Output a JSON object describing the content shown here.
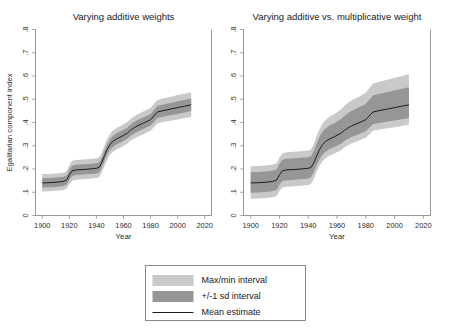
{
  "figure": {
    "width": 449,
    "height": 330,
    "background": "#ffffff"
  },
  "colors": {
    "maxmin_band": "#c9c9c9",
    "sd_band": "#969696",
    "mean_line": "#1c1c1c",
    "axis": "#8a8a8a",
    "text": "#1a1a1a"
  },
  "legend": {
    "position": "bottom-center",
    "items": [
      {
        "label": "Max/min interval",
        "marker": "filled-swatch",
        "color": "#c9c9c9"
      },
      {
        "label": "+/-1 sd interval",
        "marker": "filled-swatch",
        "color": "#969696"
      },
      {
        "label": "Mean estimate",
        "marker": "line",
        "color": "#1c1c1c"
      }
    ]
  },
  "chart_data": [
    {
      "type": "area",
      "panel": "left",
      "title": "Varying additive weights",
      "xlabel": "Year",
      "ylabel": "Egalitarian component index",
      "xlim": [
        1895,
        2025
      ],
      "ylim": [
        0,
        0.8
      ],
      "xticks": [
        1900,
        1920,
        1940,
        1960,
        1980,
        2000,
        2020
      ],
      "xticklabels": [
        "1900",
        "1920",
        "1940",
        "1960",
        "1980",
        "2000",
        "2020"
      ],
      "yticks": [
        0,
        0.1,
        0.2,
        0.3,
        0.4,
        0.5,
        0.6,
        0.7,
        0.8
      ],
      "yticklabels": [
        "0",
        ".1",
        ".2",
        ".3",
        ".4",
        ".5",
        ".6",
        ".7",
        ".8"
      ],
      "grid": false,
      "x": [
        1900,
        1905,
        1910,
        1915,
        1918,
        1920,
        1922,
        1925,
        1930,
        1935,
        1938,
        1940,
        1942,
        1944,
        1946,
        1948,
        1950,
        1952,
        1955,
        1958,
        1960,
        1963,
        1965,
        1968,
        1970,
        1975,
        1980,
        1983,
        1985,
        1990,
        1995,
        2000,
        2005,
        2010
      ],
      "series": [
        {
          "name": "Mean estimate",
          "values": [
            0.14,
            0.141,
            0.143,
            0.146,
            0.152,
            0.175,
            0.192,
            0.196,
            0.198,
            0.2,
            0.202,
            0.203,
            0.207,
            0.228,
            0.258,
            0.285,
            0.305,
            0.318,
            0.33,
            0.338,
            0.345,
            0.355,
            0.366,
            0.378,
            0.385,
            0.398,
            0.412,
            0.432,
            0.445,
            0.452,
            0.458,
            0.464,
            0.47,
            0.476
          ]
        },
        {
          "name": "+/-1 sd lower",
          "values": [
            0.12,
            0.121,
            0.123,
            0.126,
            0.132,
            0.154,
            0.17,
            0.174,
            0.176,
            0.178,
            0.18,
            0.181,
            0.185,
            0.206,
            0.235,
            0.262,
            0.282,
            0.294,
            0.306,
            0.314,
            0.321,
            0.331,
            0.342,
            0.353,
            0.36,
            0.373,
            0.387,
            0.406,
            0.419,
            0.426,
            0.432,
            0.437,
            0.443,
            0.449
          ]
        },
        {
          "name": "+/-1 sd upper",
          "values": [
            0.16,
            0.161,
            0.163,
            0.166,
            0.172,
            0.196,
            0.214,
            0.218,
            0.22,
            0.222,
            0.224,
            0.225,
            0.229,
            0.25,
            0.281,
            0.308,
            0.328,
            0.342,
            0.354,
            0.362,
            0.369,
            0.379,
            0.39,
            0.403,
            0.41,
            0.423,
            0.437,
            0.458,
            0.471,
            0.478,
            0.484,
            0.491,
            0.497,
            0.503
          ]
        },
        {
          "name": "Max/min lower",
          "values": [
            0.103,
            0.104,
            0.106,
            0.109,
            0.115,
            0.134,
            0.15,
            0.154,
            0.156,
            0.158,
            0.16,
            0.161,
            0.165,
            0.186,
            0.214,
            0.241,
            0.261,
            0.273,
            0.285,
            0.293,
            0.3,
            0.31,
            0.321,
            0.331,
            0.338,
            0.351,
            0.364,
            0.383,
            0.396,
            0.403,
            0.408,
            0.413,
            0.419,
            0.424
          ]
        },
        {
          "name": "Max/min upper",
          "values": [
            0.178,
            0.179,
            0.181,
            0.184,
            0.19,
            0.216,
            0.235,
            0.239,
            0.241,
            0.243,
            0.245,
            0.246,
            0.25,
            0.272,
            0.303,
            0.331,
            0.351,
            0.365,
            0.377,
            0.385,
            0.392,
            0.403,
            0.414,
            0.427,
            0.434,
            0.448,
            0.462,
            0.484,
            0.497,
            0.504,
            0.511,
            0.518,
            0.524,
            0.53
          ]
        }
      ]
    },
    {
      "type": "area",
      "panel": "right",
      "title": "Varying additive vs. multiplicative weight",
      "xlabel": "Year",
      "ylabel": "",
      "xlim": [
        1895,
        2025
      ],
      "ylim": [
        0,
        0.8
      ],
      "xticks": [
        1900,
        1920,
        1940,
        1960,
        1980,
        2000,
        2020
      ],
      "xticklabels": [
        "1900",
        "1920",
        "1940",
        "1960",
        "1980",
        "2000",
        "2020"
      ],
      "yticks": [
        0,
        0.1,
        0.2,
        0.3,
        0.4,
        0.5,
        0.6,
        0.7,
        0.8
      ],
      "yticklabels": [
        "0",
        ".1",
        ".2",
        ".3",
        ".4",
        ".5",
        ".6",
        ".7",
        ".8"
      ],
      "grid": false,
      "x": [
        1900,
        1905,
        1910,
        1915,
        1918,
        1920,
        1922,
        1925,
        1930,
        1935,
        1938,
        1940,
        1942,
        1944,
        1946,
        1948,
        1950,
        1952,
        1955,
        1958,
        1960,
        1963,
        1965,
        1968,
        1970,
        1975,
        1980,
        1983,
        1985,
        1990,
        1995,
        2000,
        2005,
        2010
      ],
      "series": [
        {
          "name": "Mean estimate",
          "values": [
            0.14,
            0.141,
            0.143,
            0.146,
            0.152,
            0.175,
            0.192,
            0.196,
            0.198,
            0.2,
            0.202,
            0.203,
            0.207,
            0.228,
            0.258,
            0.285,
            0.305,
            0.318,
            0.33,
            0.338,
            0.345,
            0.355,
            0.366,
            0.378,
            0.385,
            0.398,
            0.412,
            0.432,
            0.445,
            0.452,
            0.458,
            0.464,
            0.47,
            0.476
          ]
        },
        {
          "name": "+/-1 sd lower",
          "values": [
            0.098,
            0.099,
            0.101,
            0.104,
            0.11,
            0.132,
            0.148,
            0.152,
            0.154,
            0.156,
            0.158,
            0.159,
            0.165,
            0.188,
            0.218,
            0.244,
            0.262,
            0.274,
            0.286,
            0.294,
            0.3,
            0.31,
            0.32,
            0.331,
            0.338,
            0.35,
            0.362,
            0.381,
            0.393,
            0.399,
            0.404,
            0.409,
            0.414,
            0.419
          ]
        },
        {
          "name": "+/-1 sd upper",
          "values": [
            0.186,
            0.187,
            0.189,
            0.192,
            0.198,
            0.222,
            0.24,
            0.244,
            0.246,
            0.248,
            0.25,
            0.251,
            0.256,
            0.28,
            0.312,
            0.34,
            0.36,
            0.374,
            0.388,
            0.396,
            0.404,
            0.416,
            0.428,
            0.442,
            0.45,
            0.464,
            0.48,
            0.502,
            0.516,
            0.524,
            0.531,
            0.538,
            0.545,
            0.552
          ]
        },
        {
          "name": "Max/min lower",
          "values": [
            0.072,
            0.073,
            0.075,
            0.078,
            0.084,
            0.105,
            0.12,
            0.124,
            0.126,
            0.128,
            0.13,
            0.131,
            0.137,
            0.16,
            0.19,
            0.216,
            0.234,
            0.246,
            0.258,
            0.266,
            0.272,
            0.282,
            0.292,
            0.303,
            0.31,
            0.322,
            0.334,
            0.352,
            0.364,
            0.37,
            0.375,
            0.38,
            0.385,
            0.39
          ]
        },
        {
          "name": "Max/min upper",
          "values": [
            0.212,
            0.213,
            0.215,
            0.218,
            0.224,
            0.25,
            0.268,
            0.272,
            0.274,
            0.276,
            0.278,
            0.279,
            0.285,
            0.31,
            0.344,
            0.374,
            0.396,
            0.411,
            0.426,
            0.435,
            0.444,
            0.457,
            0.47,
            0.486,
            0.495,
            0.51,
            0.528,
            0.552,
            0.567,
            0.576,
            0.584,
            0.592,
            0.6,
            0.608
          ]
        }
      ]
    }
  ]
}
